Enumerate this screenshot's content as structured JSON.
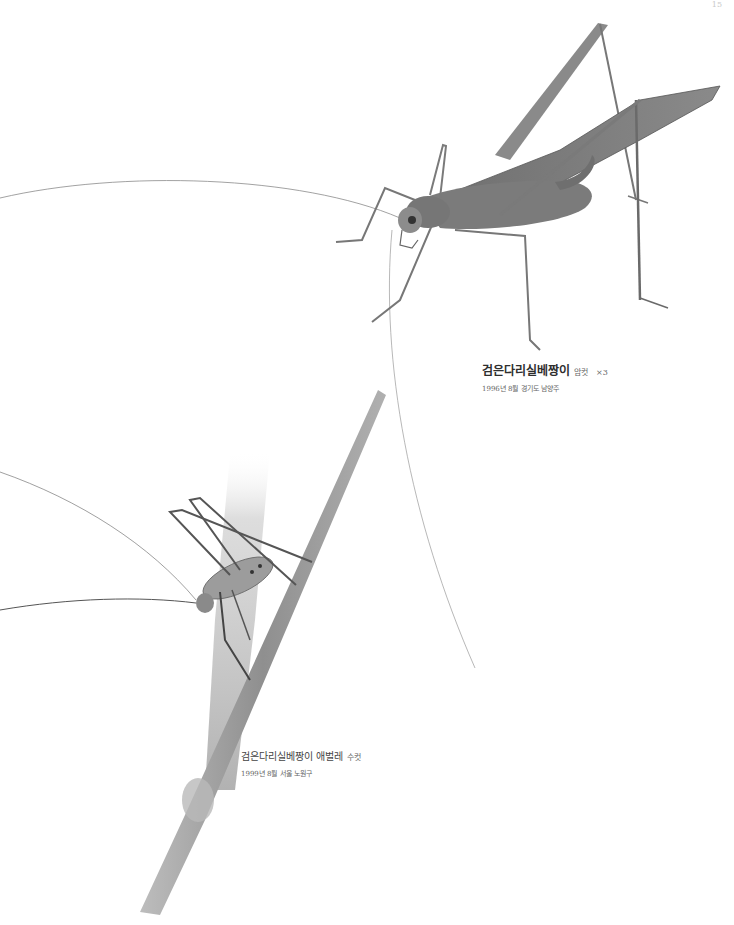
{
  "page": {
    "number": "15"
  },
  "figures": [
    {
      "title": "검은다리실베짱이",
      "sex": "암컷",
      "scale": "×3",
      "date_location": "1996년 8월 경기도 남양주",
      "subject": "adult-female-katydid-illustration"
    },
    {
      "title": "검은다리실베짱이 애벌레",
      "sex": "수컷",
      "date_location": "1999년 8월 서울 노원구",
      "subject": "nymph-male-katydid-on-grass-stem-illustration"
    }
  ],
  "colors": {
    "background": "#ffffff",
    "ink": "#555555",
    "stem": "#9a9a9a"
  }
}
